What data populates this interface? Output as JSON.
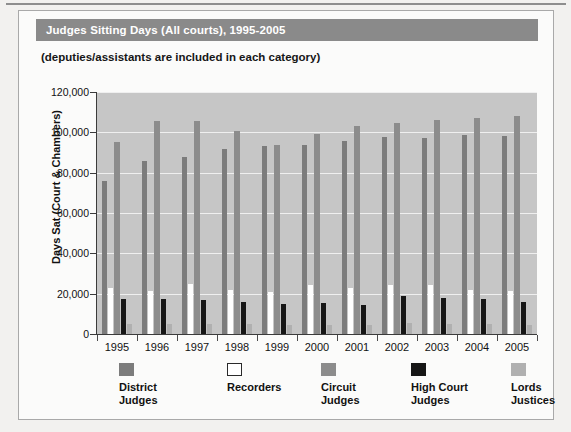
{
  "title": "Judges Sitting Days (All courts), 1995-2005",
  "subtitle": "(deputies/assistants are included in each category)",
  "legend": [
    {
      "label": "District\nJudges",
      "color": "#7c7c7c",
      "swatch": "district-swatch"
    },
    {
      "label": "Recorders",
      "color": "#ffffff",
      "swatch": "recorders-swatch"
    },
    {
      "label": "Circuit\nJudges",
      "color": "#8c8c8c",
      "swatch": "circuit-swatch"
    },
    {
      "label": "High Court\nJudges",
      "color": "#161616",
      "swatch": "high-court-swatch"
    },
    {
      "label": "Lords\nJustices",
      "color": "#b0b0b0",
      "swatch": "lords-swatch"
    }
  ],
  "chart_data": {
    "type": "bar",
    "title": "Judges Sitting Days (All courts), 1995-2005",
    "subtitle": "(deputies/assistants are included in each category)",
    "xlabel": "",
    "ylabel": "Days Sat (Court & Chambers)",
    "ylim": [
      0,
      120000
    ],
    "ytick_step": 20000,
    "ytick_labels": [
      "0",
      "20,000",
      "40,000",
      "60,000",
      "80,000",
      "100,000",
      "120,000"
    ],
    "grid": true,
    "legend_position": "bottom",
    "plot_background": "#c6c6c6",
    "categories": [
      "1995",
      "1996",
      "1997",
      "1998",
      "1999",
      "2000",
      "2001",
      "2002",
      "2003",
      "2004",
      "2005"
    ],
    "series": [
      {
        "name": "District Judges",
        "color": "#7c7c7c",
        "values": [
          76000,
          86000,
          88000,
          91500,
          93000,
          93500,
          95500,
          97500,
          97000,
          98500,
          98000
        ]
      },
      {
        "name": "Recorders",
        "color": "#ffffff",
        "values": [
          23000,
          21500,
          25000,
          22000,
          21000,
          24500,
          23000,
          24500,
          24500,
          22000,
          21500
        ]
      },
      {
        "name": "Circuit Judges",
        "color": "#8c8c8c",
        "values": [
          95000,
          105500,
          105500,
          100500,
          93500,
          99000,
          103000,
          104500,
          106000,
          107000,
          108000
        ]
      },
      {
        "name": "High Court Judges",
        "color": "#161616",
        "values": [
          17500,
          17500,
          17000,
          16000,
          15000,
          15500,
          14500,
          19000,
          18000,
          17500,
          16000
        ]
      },
      {
        "name": "Lords Justices",
        "color": "#b0b0b0",
        "values": [
          5000,
          5000,
          5000,
          5000,
          4500,
          4500,
          4500,
          5500,
          5000,
          5000,
          4500
        ]
      }
    ]
  }
}
